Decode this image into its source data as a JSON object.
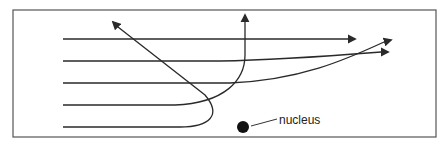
{
  "diagram": {
    "title": "",
    "nucleus_label": "nucleus",
    "colors": {
      "line": "#2a2a2a",
      "frame": "#555555",
      "nucleus": "#111111",
      "background": "#ffffff"
    },
    "frame": {
      "x": 13,
      "y": 10,
      "width": 423,
      "height": 127
    },
    "nucleus": {
      "cx": 243,
      "cy": 127,
      "r": 6
    },
    "paths": [
      {
        "name": "path-1-undeflected",
        "d": "M63,39 L348,39",
        "arrow_at": [
          355,
          39
        ]
      },
      {
        "name": "path-2-slight-deflection",
        "d": "M63,61 L220,61 C280,60 330,56 381,52",
        "arrow_at": [
          388,
          52
        ]
      },
      {
        "name": "path-3-moderate-deflection",
        "d": "M63,83 L230,83 C300,80 345,60 384,42",
        "arrow_at": [
          391,
          40
        ]
      },
      {
        "name": "path-4-large-deflection",
        "d": "M63,105 L175,105 C225,103 245,80 245,55 L245,22",
        "arrow_at": [
          245,
          15
        ]
      },
      {
        "name": "path-5-backscatter",
        "d": "M63,127 L180,127 C210,127 222,115 205,95 L118,27",
        "arrow_at": [
          113,
          22
        ]
      }
    ]
  }
}
